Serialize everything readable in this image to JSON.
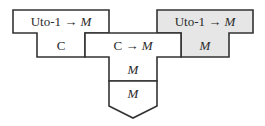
{
  "diagram": {
    "colors": {
      "stroke": "#333333",
      "fill_default": "#ffffff",
      "fill_highlight": "#e6e6e6"
    },
    "pieces": [
      {
        "id": "left-piece",
        "top_label": {
          "prefix": "Uto-1 → ",
          "type": "M"
        },
        "bottom_label": "C",
        "highlighted": false
      },
      {
        "id": "middle-piece",
        "top_label": {
          "prefix": "C → ",
          "type": "M"
        },
        "stem_labels": [
          "M",
          "M"
        ],
        "highlighted": false
      },
      {
        "id": "right-piece",
        "top_label": {
          "prefix": "Uto-1 → ",
          "type": "M"
        },
        "bottom_label": "M",
        "highlighted": true
      }
    ]
  }
}
